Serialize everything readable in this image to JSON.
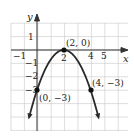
{
  "chart_data": {
    "type": "line",
    "title": "",
    "xlabel": "x",
    "ylabel": "y",
    "function": "y = -3/4 (x - 2)^2",
    "xlim": [
      -2,
      6
    ],
    "ylim": [
      -6,
      2
    ],
    "grid": true,
    "x_tick_labels": [
      "-1",
      "2",
      "4",
      "5"
    ],
    "y_tick_labels": [
      "1",
      "-1",
      "-2",
      "-3"
    ],
    "points": [
      {
        "x": 2,
        "y": 0,
        "label": "(2, 0)"
      },
      {
        "x": 0,
        "y": -3,
        "label": "(0, −3)"
      },
      {
        "x": 4,
        "y": -3,
        "label": "(4, −3)"
      }
    ],
    "curve_color": "#2a2a2a",
    "grid_color": "#c8c8c8"
  },
  "axes": {
    "x_label": "x",
    "y_label": "y",
    "x_ticks": [
      {
        "value": -1,
        "label": "−1"
      },
      {
        "value": 2,
        "label": "2"
      },
      {
        "value": 4,
        "label": "4"
      },
      {
        "value": 5,
        "label": "5"
      }
    ],
    "y_ticks": [
      {
        "value": 1,
        "label": "1"
      },
      {
        "value": -1,
        "label": "−1"
      },
      {
        "value": -2,
        "label": "−2"
      },
      {
        "value": -3,
        "label": "−3"
      }
    ]
  },
  "labels": {
    "vertex": "(2, 0)",
    "y_intercept": "(0, −3)",
    "symmetric_point": "(4, −3)"
  }
}
